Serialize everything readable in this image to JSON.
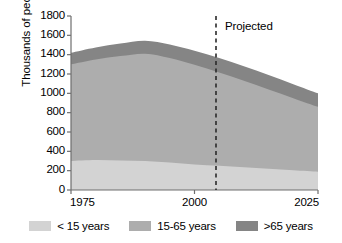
{
  "chart_data": {
    "type": "area",
    "title": "",
    "subtitle": "",
    "xlabel": "",
    "ylabel": "Thousands of people",
    "stacked": true,
    "grid": false,
    "legend_position": "bottom",
    "xlim": [
      1975,
      2025
    ],
    "ylim": [
      0,
      1800
    ],
    "ytick_labels": [
      "1800",
      "1600",
      "1400",
      "1200",
      "1000",
      "800",
      "600",
      "400",
      "200",
      "0"
    ],
    "ytick_values": [
      1800,
      1600,
      1400,
      1200,
      1000,
      800,
      600,
      400,
      200,
      0
    ],
    "xtick_labels": [
      "1975",
      "2000",
      "2025"
    ],
    "xtick_values": [
      1975,
      2000,
      2025
    ],
    "x": [
      1975,
      1980,
      1985,
      1990,
      1995,
      2000,
      2005,
      2010,
      2015,
      2020,
      2025
    ],
    "series": [
      {
        "name": "< 15 years",
        "color": "#d3d3d3",
        "values": [
          300,
          310,
          305,
          300,
          285,
          265,
          250,
          235,
          220,
          205,
          190
        ]
      },
      {
        "name": "15-65 years",
        "color": "#adadad",
        "values": [
          1000,
          1040,
          1080,
          1110,
          1080,
          1030,
          965,
          895,
          820,
          745,
          670
        ]
      },
      {
        "name": ">65 years",
        "color": "#858585",
        "values": [
          120,
          125,
          130,
          135,
          140,
          145,
          150,
          150,
          150,
          145,
          140
        ]
      }
    ],
    "totals": [
      1420,
      1475,
      1515,
      1545,
      1505,
      1440,
      1365,
      1280,
      1190,
      1095,
      1000
    ],
    "annotations": [
      {
        "name": "projection-divider",
        "label": "Projected",
        "x": 2006,
        "style": "dashed-vertical-line"
      }
    ]
  },
  "legend": {
    "items": [
      {
        "label": "< 15 years",
        "color": "#d3d3d3"
      },
      {
        "label": "15-65 years",
        "color": "#adadad"
      },
      {
        "label": ">65 years",
        "color": "#858585"
      }
    ]
  },
  "axes": {
    "y_title": "Thousands of people",
    "axis_color": "#6e6e6e"
  }
}
